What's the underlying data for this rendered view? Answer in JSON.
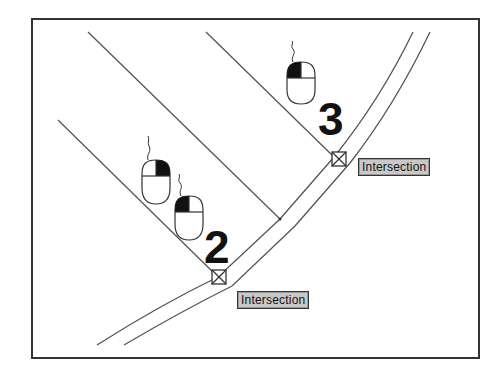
{
  "diagram": {
    "frame": {
      "x": 32,
      "y": 19,
      "width": 447,
      "height": 339,
      "stroke": "#333333"
    },
    "colors": {
      "line": "#555555",
      "frame": "#333333",
      "label_bg": "#c8c8c8",
      "mouse_fill": "#111111"
    },
    "steps": [
      {
        "number": "2",
        "snap_label": "Intersection",
        "mouse_button": "left"
      },
      {
        "number": "3",
        "snap_label": "Intersection",
        "mouse_button": "left"
      }
    ],
    "extra_mouse": {
      "mouse_button": "right"
    }
  }
}
